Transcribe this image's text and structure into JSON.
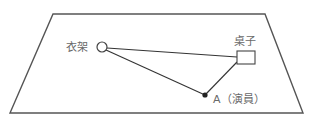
{
  "diagram": {
    "type": "stage-blocking-plan",
    "elements": {
      "coat_rack": {
        "label": "衣架",
        "shape": "circle"
      },
      "table": {
        "label": "桌子",
        "shape": "square"
      },
      "actor": {
        "label": "A（演員）",
        "shape": "dot"
      }
    },
    "connections": [
      {
        "from": "coat_rack",
        "to": "table"
      },
      {
        "from": "coat_rack",
        "to": "actor"
      },
      {
        "from": "actor",
        "to": "table"
      }
    ],
    "colors": {
      "stroke": "#333333",
      "label": "#6a6a6a",
      "background": "#ffffff"
    }
  }
}
